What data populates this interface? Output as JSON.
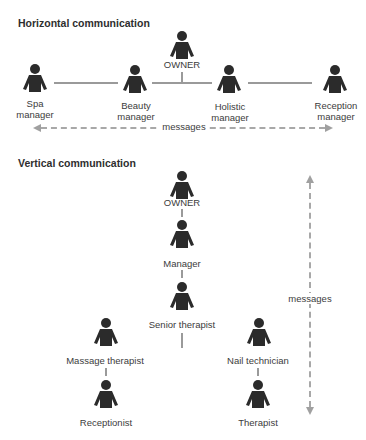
{
  "colors": {
    "figure": "#2b2b2b",
    "connector": "#9a9a9a",
    "arrow": "#a8a8a8",
    "text": "#3c3c3c"
  },
  "horizontal": {
    "title": "Horizontal communication",
    "owner": {
      "label": "OWNER",
      "icon": "person-icon"
    },
    "managers": [
      {
        "line1": "Spa",
        "line2": "manager",
        "icon": "person-icon"
      },
      {
        "line1": "Beauty",
        "line2": "manager",
        "icon": "person-icon"
      },
      {
        "line1": "Holistic",
        "line2": "manager",
        "icon": "person-icon"
      },
      {
        "line1": "Reception",
        "line2": "manager",
        "icon": "person-icon"
      }
    ],
    "arrow_label": "messages",
    "arrow_direction": "bidirectional-horizontal"
  },
  "vertical": {
    "title": "Vertical communication",
    "chain": [
      {
        "label": "OWNER",
        "icon": "person-icon"
      },
      {
        "label": "Manager",
        "icon": "person-icon"
      },
      {
        "label": "Senior therapist",
        "icon": "person-icon"
      }
    ],
    "left_branch": [
      {
        "label": "Massage therapist",
        "icon": "person-icon"
      },
      {
        "label": "Receptionist",
        "icon": "person-icon"
      }
    ],
    "right_branch": [
      {
        "label": "Nail technician",
        "icon": "person-icon"
      },
      {
        "label": "Therapist",
        "icon": "person-icon"
      }
    ],
    "arrow_label": "messages",
    "arrow_direction": "bidirectional-vertical"
  }
}
